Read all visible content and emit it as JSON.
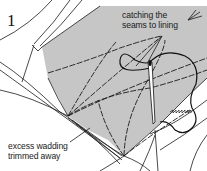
{
  "figure": {
    "step_number": "1",
    "labels": {
      "catching_seams": [
        "catching the",
        "seams to lining"
      ],
      "excess_wadding": [
        "excess wadding",
        "trimmed away"
      ]
    },
    "colors": {
      "lining_fill": "#c6c6c6",
      "line": "#1a1a1a",
      "background": "#ffffff"
    },
    "icons": [
      "needle-icon",
      "thread-icon",
      "arrow-icon"
    ]
  }
}
